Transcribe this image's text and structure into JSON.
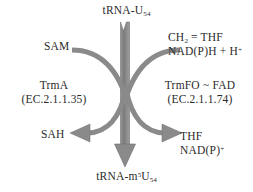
{
  "diagram": {
    "background_color": "#ffffff",
    "arrow_color": "#808080",
    "text_color": "#2b2b2b",
    "substrate": {
      "text_main": "tRNA-U",
      "text_sub": "54"
    },
    "product": {
      "text_prefix": "tRNA-m",
      "text_sup": "5",
      "text_mid": "U",
      "text_sub": "54"
    },
    "left_branch": {
      "enzyme_name": "TrmA",
      "enzyme_ec": "(EC.2.1.1.35)",
      "substrate_cofactor": "SAM",
      "product_cofactor": "SAH"
    },
    "right_branch": {
      "enzyme_name": "TrmFO ~ FAD",
      "enzyme_ec": "(EC.2.1.1.74)",
      "cofactor_in_line1_prefix": "CH",
      "cofactor_in_line1_sub": "2",
      "cofactor_in_line1_suffix": " = THF",
      "cofactor_in_line2": "NAD(P)H + H",
      "cofactor_in_line2_sup": "+",
      "cofactor_out_line1": "THF",
      "cofactor_out_line2": "NAD(P)",
      "cofactor_out_line2_sup": "+"
    }
  }
}
